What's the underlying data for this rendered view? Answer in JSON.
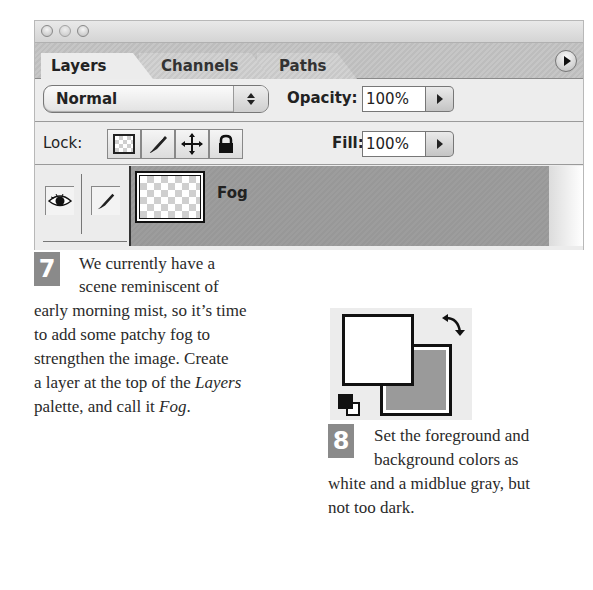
{
  "panel": {
    "window_controls": [
      "close",
      "minimize",
      "zoom"
    ],
    "tabs": [
      {
        "label": "Layers",
        "active": true
      },
      {
        "label": "Channels",
        "active": false
      },
      {
        "label": "Paths",
        "active": false
      }
    ],
    "menu_icon": "palette-menu-arrow-icon",
    "blend_mode": "Normal",
    "opacity_label": "Opacity:",
    "opacity_value": "100%",
    "lock_label": "Lock:",
    "lock_icons": [
      "lock-transparency-icon",
      "lock-paint-icon",
      "lock-position-icon",
      "lock-all-icon"
    ],
    "fill_label": "Fill:",
    "fill_value": "100%",
    "layer": {
      "name": "Fog",
      "visibility_icon": "eye-icon",
      "brush_icon": "paintbrush-icon"
    }
  },
  "step7": {
    "number": "7",
    "lines": [
      "We currently have a",
      "scene reminiscent of",
      "early morning mist, so it’s time",
      "to add some patchy fog to",
      "strengthen the image. Create"
    ],
    "line6_pre": "a layer at the top of the ",
    "line6_italic": "Layers",
    "line7_pre": "palette, and call it ",
    "line7_italic": "Fog",
    "line7_post": "."
  },
  "swatch": {
    "foreground": "#ffffff",
    "background": "#9a9a9a",
    "swap_icon": "swap-colors-icon",
    "default_icon": "default-colors-icon"
  },
  "step8": {
    "number": "8",
    "lines": [
      "Set the foreground and",
      "background colors as",
      "white and a midblue gray, but",
      "not too dark."
    ]
  }
}
